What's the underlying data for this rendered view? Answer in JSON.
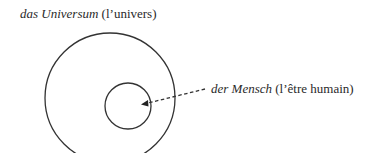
{
  "diagram": {
    "type": "nested-circles",
    "outer": {
      "term": "das Universum",
      "translation": "(l’univers)"
    },
    "inner": {
      "term": "der Mensch",
      "translation": "(l’être humain)"
    },
    "colors": {
      "stroke": "#333333",
      "text": "#2a2a2a",
      "background": "#ffffff"
    }
  }
}
